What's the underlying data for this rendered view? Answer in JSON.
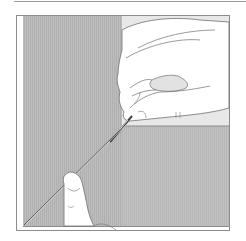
{
  "illustration": {
    "subject": "hands pulling a thread diagonally across a screen panel",
    "colors": {
      "background": "#ffffff",
      "frame": "#8c8c8c",
      "panel_left": "#b4b4b4",
      "panel_top_right": "#e6e6e6",
      "panel_bottom_right": "#bdbdbd",
      "outline": "#6e6e6e",
      "skin": "#ffffff",
      "fingernail_shade": "#e2e2e2",
      "thread": "#444444"
    }
  }
}
